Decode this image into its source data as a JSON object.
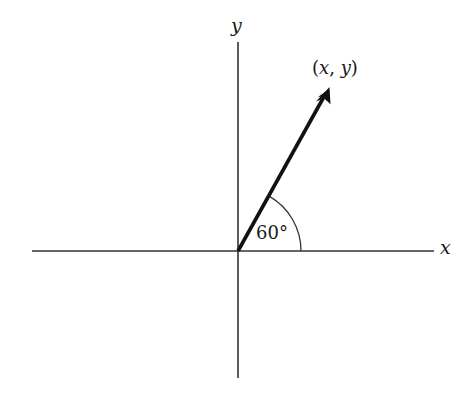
{
  "diagram": {
    "title": "",
    "axes": {
      "x_label": "x",
      "y_label": "y"
    },
    "vector": {
      "from": "origin",
      "endpoint_label_open": "(",
      "endpoint_label_x": "x",
      "endpoint_label_sep": ", ",
      "endpoint_label_y": "y",
      "endpoint_label_close": ")"
    },
    "angle": {
      "value": "60",
      "unit": "°",
      "text": "60°"
    },
    "colors": {
      "axis": "#333333",
      "vector": "#111111",
      "arc": "#333333",
      "background": "#ffffff"
    }
  }
}
